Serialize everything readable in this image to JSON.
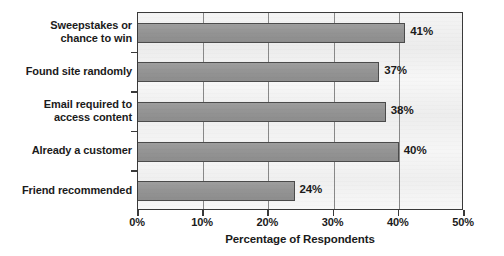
{
  "chart_data": {
    "type": "bar",
    "orientation": "horizontal",
    "title": "",
    "subtitle": "",
    "xlabel": "Percentage of Respondents",
    "ylabel": "",
    "xlim": [
      0,
      50
    ],
    "xticks": [
      "0%",
      "10%",
      "20%",
      "30%",
      "40%",
      "50%"
    ],
    "xtick_values": [
      0,
      10,
      20,
      30,
      40,
      50
    ],
    "grid": "vertical",
    "legend": "none",
    "categories": [
      "Sweepstakes or\nchance to win",
      "Found site randomly",
      "Email required to\naccess content",
      "Already a customer",
      "Friend recommended"
    ],
    "values": [
      41,
      37,
      38,
      40,
      24
    ],
    "data_labels": [
      "41%",
      "37%",
      "38%",
      "40%",
      "24%"
    ],
    "colors": {
      "bar_fill": "#979797",
      "bar_border": "#4b4b4b",
      "frame_border": "#3a3a3a",
      "gridline": "#888888",
      "plot_background": "#f2f2f2",
      "text": "#1b1b1b",
      "page_background": "#ffffff"
    }
  }
}
